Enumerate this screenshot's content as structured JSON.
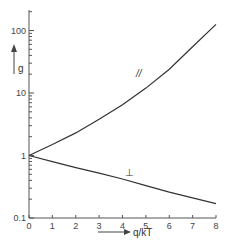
{
  "chart_data": {
    "type": "line",
    "title": "",
    "xlabel": "q/kT",
    "ylabel": "g",
    "xlim": [
      0,
      8
    ],
    "ylim": [
      0.1,
      200
    ],
    "yscale": "log",
    "grid": false,
    "x_ticks": [
      "0",
      "1",
      "2",
      "3",
      "4",
      "5",
      "6",
      "7",
      "8"
    ],
    "y_ticks": [
      "0.1",
      "1",
      "10",
      "100"
    ],
    "series": [
      {
        "name": "//",
        "x": [
          0,
          1,
          2,
          3,
          4,
          5,
          6,
          7,
          8
        ],
        "values": [
          1,
          1.5,
          2.3,
          3.8,
          6.5,
          12,
          24,
          55,
          125
        ]
      },
      {
        "name": "⊥",
        "x": [
          0,
          1,
          2,
          3,
          4,
          5,
          6,
          7,
          8
        ],
        "values": [
          1,
          0.8,
          0.64,
          0.52,
          0.42,
          0.33,
          0.26,
          0.21,
          0.17
        ]
      }
    ],
    "annotations": [
      {
        "text": "//",
        "near_series": "//"
      },
      {
        "text": "⊥",
        "near_series": "⊥"
      }
    ]
  }
}
